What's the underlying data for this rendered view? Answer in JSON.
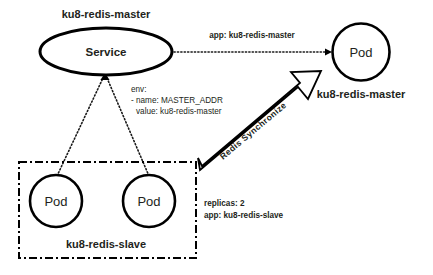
{
  "diagram": {
    "type": "kubernetes-architecture",
    "background_color": "#ffffff",
    "stroke_color": "#000000",
    "text_color": "#231f20"
  },
  "master_service": {
    "title": "ku8-redis-master",
    "node_label": "Service"
  },
  "master_pod": {
    "node_label": "Pod",
    "caption": "ku8-redis-master"
  },
  "slave_group": {
    "caption": "ku8-redis-slave",
    "pods": [
      {
        "node_label": "Pod"
      },
      {
        "node_label": "Pod"
      }
    ],
    "annotation": {
      "lines": [
        "replicas: 2",
        "app: ku8-redis-slave"
      ]
    }
  },
  "selector_link": {
    "label": "app: ku8-redis-master"
  },
  "env_annotation": {
    "lines": [
      "env:",
      "- name: MASTER_ADDR",
      "  value: ku8-redis-master"
    ],
    "line1": "env:",
    "line2": "- name: MASTER_ADDR",
    "line3": "value: ku8-redis-master"
  },
  "sync_arrow": {
    "label": "Redis Synchronize"
  }
}
